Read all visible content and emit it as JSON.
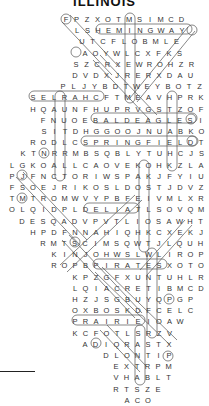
{
  "title": "ILLINOIS",
  "grid": {
    "pitch_x": 10.5,
    "pitch_y": 11.2,
    "top": 14,
    "rows": [
      {
        "x": 66,
        "letters": "FPZXOTMSIMCD"
      },
      {
        "x": 77,
        "letters": "LSHEMINGWAY"
      },
      {
        "x": 82,
        "letters": "UTCFLOBMLE"
      },
      {
        "x": 85,
        "letters": "AOYWLCXFKS"
      },
      {
        "x": 76,
        "letters": "SZCRXEWROHZR"
      },
      {
        "x": 75,
        "letters": "DVDXJRERXDAU"
      },
      {
        "x": 63,
        "letters": "PLJYBDTWEYBOTZ"
      },
      {
        "x": 33,
        "letters": "SELRAHCFTMEAVHPRK"
      },
      {
        "x": 33,
        "letters": "HQAUNFHUPRVGSTZOF"
      },
      {
        "x": 43,
        "letters": "FNUOEBALDEAGLESI"
      },
      {
        "x": 44,
        "letters": "SITDHGGOOJNUABKO"
      },
      {
        "x": 33,
        "letters": "RODLCSPRINGFIELDT"
      },
      {
        "x": 23,
        "letters": "KTNRRMBSQBLYTUHCJS"
      },
      {
        "x": 12,
        "letters": "LGKOALLCAOVEKOHKZLA"
      },
      {
        "x": 12,
        "letters": "PJFNCTORIWSPAKJFYIU"
      },
      {
        "x": 12,
        "letters": "FSOEJRIKOSLDOSTJDVZ"
      },
      {
        "x": 12,
        "letters": "TMTROMWVYPBFEIVMLXR"
      },
      {
        "x": 12,
        "letters": "OLQIDPLDELIATLSOVQM"
      },
      {
        "x": 22,
        "letters": "DESQADVPVTLIOSAWHT"
      },
      {
        "x": 33,
        "letters": "HPDFNNAHIQHKCXEKJ"
      },
      {
        "x": 43,
        "letters": "RMTSCIMSQWTJLQUH"
      },
      {
        "x": 54,
        "letters": "KINJOHWSLWLIROP"
      },
      {
        "x": 54,
        "letters": "ROPBPIRATESXOTO"
      },
      {
        "x": 75,
        "letters": "KPZGFXUNTUHLR"
      },
      {
        "x": 75,
        "letters": "LQIACRETIBMCD"
      },
      {
        "x": 75,
        "letters": "HZJSGBUYQPGP"
      },
      {
        "x": 75,
        "letters": "OXBOSKDFCELC"
      },
      {
        "x": 75,
        "letters": "PRAIRIEIOAW"
      },
      {
        "x": 75,
        "letters": "KCFOTLSRZV"
      },
      {
        "x": 85,
        "letters": "ADIQRASTX"
      },
      {
        "x": 106,
        "letters": "DLONTIP"
      },
      {
        "x": 116,
        "letters": "EXTRPM"
      },
      {
        "x": 116,
        "letters": "VHABLT"
      },
      {
        "x": 116,
        "letters": "RTSZE"
      },
      {
        "x": 127,
        "letters": "ACO"
      }
    ]
  },
  "found_words": [
    {
      "word": "HEMINGWAY",
      "direction": "horizontal",
      "row": 2,
      "start_col": 2,
      "length": 9
    },
    {
      "word": "SELRAHC",
      "direction": "horizontal",
      "row": 8,
      "start_col": 0,
      "length": 7
    },
    {
      "word": "BALDEAGLES",
      "direction": "horizontal",
      "row": 10,
      "start_col": 5,
      "length": 10
    },
    {
      "word": "SPRINGFIELD",
      "direction": "horizontal",
      "row": 12,
      "start_col": 5,
      "length": 11
    },
    {
      "word": "DELIAT",
      "direction": "horizontal",
      "row": 18,
      "start_col": 7,
      "length": 6
    },
    {
      "word": "PIRATES",
      "direction": "horizontal",
      "row": 23,
      "start_col": 4,
      "length": 7
    },
    {
      "word": "PRAIRIE",
      "direction": "horizontal",
      "row": 28,
      "start_col": 0,
      "length": 7
    }
  ],
  "colors": {
    "text": "#333333",
    "marks": "#555555",
    "title": "#111111"
  }
}
